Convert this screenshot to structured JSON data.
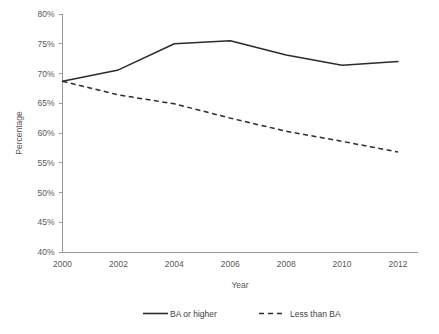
{
  "chart_data": {
    "type": "line",
    "title": "",
    "xlabel": "Year",
    "ylabel": "Percentage",
    "x": [
      2000,
      2002,
      2004,
      2006,
      2008,
      2010,
      2012
    ],
    "xticklabels": [
      "2000",
      "2002",
      "2004",
      "2006",
      "2008",
      "2010",
      "2012"
    ],
    "yticklabels": [
      "40%",
      "45%",
      "50%",
      "55%",
      "60%",
      "65%",
      "70%",
      "75%",
      "80%"
    ],
    "ytickvalues": [
      40,
      45,
      50,
      55,
      60,
      65,
      70,
      75,
      80
    ],
    "xlim": [
      2000,
      2012
    ],
    "ylim": [
      40,
      80
    ],
    "grid": false,
    "legend_position": "bottom",
    "series": [
      {
        "name": "BA or higher",
        "style": "solid",
        "color": "#2b2b2b",
        "values": [
          68.7,
          70.6,
          75.0,
          75.5,
          73.1,
          71.4,
          72.0
        ]
      },
      {
        "name": "Less than BA",
        "style": "dashed",
        "color": "#2b2b2b",
        "values": [
          68.7,
          66.4,
          64.9,
          62.5,
          60.3,
          58.6,
          56.8
        ]
      }
    ]
  },
  "axis": {
    "y_title": "Percentage",
    "x_title": "Year"
  },
  "legend": {
    "items": [
      {
        "label": "BA or higher",
        "style": "solid"
      },
      {
        "label": "Less than BA",
        "style": "dashed"
      }
    ]
  }
}
